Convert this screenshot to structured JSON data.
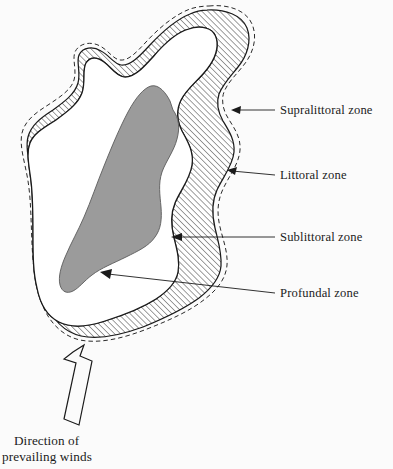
{
  "figure": {
    "background_color": "#fbfbfb",
    "ink_color": "#1b1b1b",
    "profundal_fill_color": "#9b9b9b",
    "sublittoral_fill_color": "#ffffff",
    "littoral_fill_pattern": "diagonal-hatch",
    "supralittoral_boundary": "dashed"
  },
  "labels": {
    "supralittoral": "Supralittoral zone",
    "littoral": "Littoral zone",
    "sublittoral": "Sublittoral zone",
    "profundal": "Profundal zone"
  },
  "wind": {
    "line1": "Direction of",
    "line2": "prevailing winds",
    "arrow_direction": "up-right"
  }
}
